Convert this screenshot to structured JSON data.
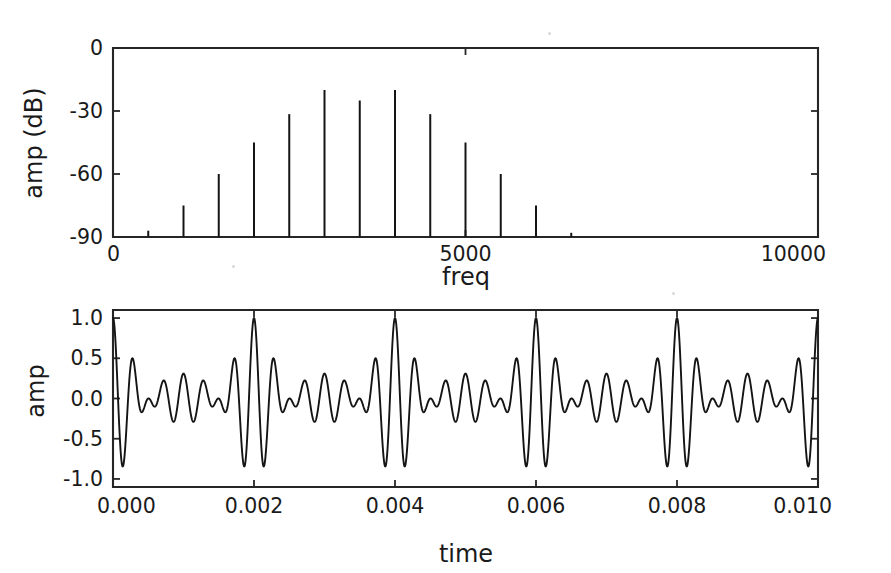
{
  "figure": {
    "background_color": "#ffffff",
    "line_color": "#141414",
    "axis_color": "#262626"
  },
  "chart_data": [
    {
      "type": "bar",
      "name": "magnitude-spectrum",
      "title": "",
      "xlabel": "freq",
      "ylabel": "amp (dB)",
      "xlim": [
        0,
        10000
      ],
      "ylim": [
        -90,
        0
      ],
      "xticks": [
        0,
        5000,
        10000
      ],
      "xticklabels": [
        "0",
        "5000",
        "10000"
      ],
      "yticks": [
        0,
        -30,
        -60,
        -90
      ],
      "yticklabels": [
        "0",
        "-30",
        "-60",
        "-90"
      ],
      "grid": false,
      "legend": false,
      "baseline": -90,
      "x": [
        500,
        1000,
        1500,
        2000,
        2500,
        3000,
        3200,
        3500,
        4000,
        4500,
        5000,
        5500,
        6000,
        6500
      ],
      "values": [
        -87,
        -75,
        -60,
        -45,
        -31.5,
        -20,
        -90,
        -25,
        -20,
        -31.5,
        -45,
        -60,
        -75,
        -88
      ],
      "categories": [
        "500",
        "1000",
        "1500",
        "2000",
        "2500",
        "3000",
        "3200",
        "3500",
        "4000",
        "4500",
        "5000",
        "5500",
        "6000",
        "6500"
      ]
    },
    {
      "type": "line",
      "name": "time-waveform",
      "title": "",
      "xlabel": "time",
      "ylabel": "amp",
      "xlim": [
        0.0,
        0.01
      ],
      "ylim": [
        -1.1,
        1.1
      ],
      "xticks": [
        0.0,
        0.002,
        0.004,
        0.006,
        0.008,
        0.01
      ],
      "xticklabels": [
        "0.000",
        "0.002",
        "0.004",
        "0.006",
        "0.008",
        "0.010"
      ],
      "yticks": [
        1.0,
        0.5,
        0.0,
        -0.5,
        -1.0
      ],
      "yticklabels": [
        "1.0",
        "0.5",
        "0.0",
        "-0.5",
        "-1.0"
      ],
      "grid": false,
      "legend": false,
      "fundamental_hz": 500,
      "period_s": 0.002,
      "series": [
        {
          "name": "signal",
          "harmonics_hz": [
            500,
            1000,
            1500,
            2000,
            2500,
            3000,
            3500,
            4000,
            4500,
            5000,
            5500,
            6000,
            6500
          ],
          "harmonic_amplitudes": [
            4e-05,
            0.00018,
            0.001,
            0.0056,
            0.0266,
            0.1,
            0.0562,
            0.1,
            0.0266,
            0.0056,
            0.001,
            0.00018,
            4e-05
          ],
          "peak_value": 1.0,
          "min_value": -0.95
        }
      ]
    }
  ]
}
